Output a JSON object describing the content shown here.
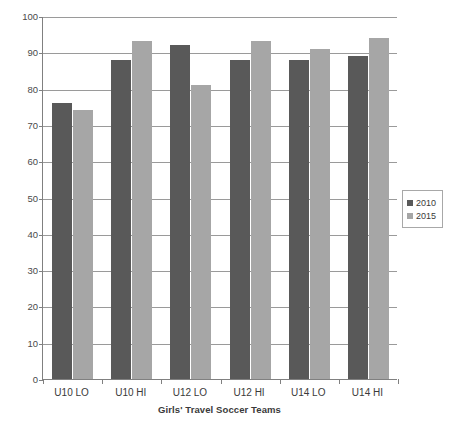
{
  "chart_data": {
    "type": "bar",
    "title": "",
    "xlabel": "Girls' Travel Soccer Teams",
    "ylabel": "Male Head Coaches (percentage)",
    "categories": [
      "U10 LO",
      "U10 HI",
      "U12 LO",
      "U12 HI",
      "U14 LO",
      "U14 HI"
    ],
    "series": [
      {
        "name": "2010",
        "color": "#595959",
        "values": [
          76,
          88,
          92,
          88,
          88,
          89
        ]
      },
      {
        "name": "2015",
        "color": "#a6a6a6",
        "values": [
          74,
          93,
          81,
          93,
          91,
          94
        ]
      }
    ],
    "ylim": [
      0,
      100
    ],
    "yticks": [
      0,
      10,
      20,
      30,
      40,
      50,
      60,
      70,
      80,
      90,
      100
    ],
    "ytick_labels": [
      "0",
      "10",
      "20",
      "30",
      "40",
      "50",
      "60",
      "70",
      "80",
      "90",
      "100"
    ],
    "grid": "horizontal",
    "legend_position": "right",
    "legend_entries": [
      "2010",
      "2015"
    ]
  }
}
